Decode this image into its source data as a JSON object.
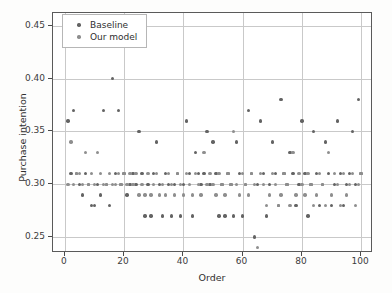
{
  "chart_data": {
    "type": "scatter",
    "title": "",
    "xlabel": "Order",
    "ylabel": "Purchase intention",
    "xlim": [
      -4,
      104
    ],
    "ylim": [
      0.235,
      0.462
    ],
    "xticks": [
      0,
      20,
      40,
      60,
      80,
      100
    ],
    "xtick_labels": [
      "0",
      "20",
      "40",
      "60",
      "80",
      "100"
    ],
    "yticks": [
      0.25,
      0.3,
      0.35,
      0.4,
      0.45
    ],
    "ytick_labels": [
      "0.25",
      "0.30",
      "0.35",
      "0.40",
      "0.45"
    ],
    "grid": true,
    "legend_position": "upper left",
    "series": [
      {
        "name": "Baseline",
        "color": "#636363",
        "marker": "circle",
        "points": [
          [
            1,
            0.36
          ],
          [
            2,
            0.31
          ],
          [
            3,
            0.37
          ],
          [
            4,
            0.31
          ],
          [
            5,
            0.3
          ],
          [
            6,
            0.29
          ],
          [
            7,
            0.31
          ],
          [
            8,
            0.3
          ],
          [
            9,
            0.28
          ],
          [
            10,
            0.28
          ],
          [
            11,
            0.3
          ],
          [
            12,
            0.29
          ],
          [
            13,
            0.37
          ],
          [
            14,
            0.3
          ],
          [
            15,
            0.28
          ],
          [
            16,
            0.4
          ],
          [
            17,
            0.31
          ],
          [
            18,
            0.37
          ],
          [
            19,
            0.3
          ],
          [
            20,
            0.31
          ],
          [
            21,
            0.29
          ],
          [
            22,
            0.3
          ],
          [
            23,
            0.31
          ],
          [
            24,
            0.3
          ],
          [
            25,
            0.35
          ],
          [
            26,
            0.31
          ],
          [
            27,
            0.27
          ],
          [
            28,
            0.3
          ],
          [
            29,
            0.27
          ],
          [
            30,
            0.31
          ],
          [
            31,
            0.34
          ],
          [
            32,
            0.3
          ],
          [
            33,
            0.27
          ],
          [
            34,
            0.31
          ],
          [
            35,
            0.3
          ],
          [
            36,
            0.27
          ],
          [
            37,
            0.3
          ],
          [
            38,
            0.31
          ],
          [
            39,
            0.27
          ],
          [
            40,
            0.3
          ],
          [
            41,
            0.36
          ],
          [
            42,
            0.31
          ],
          [
            43,
            0.27
          ],
          [
            44,
            0.33
          ],
          [
            45,
            0.31
          ],
          [
            46,
            0.3
          ],
          [
            47,
            0.31
          ],
          [
            48,
            0.35
          ],
          [
            49,
            0.3
          ],
          [
            50,
            0.34
          ],
          [
            51,
            0.31
          ],
          [
            52,
            0.27
          ],
          [
            53,
            0.3
          ],
          [
            54,
            0.27
          ],
          [
            55,
            0.31
          ],
          [
            56,
            0.3
          ],
          [
            57,
            0.27
          ],
          [
            58,
            0.34
          ],
          [
            59,
            0.31
          ],
          [
            60,
            0.27
          ],
          [
            61,
            0.3
          ],
          [
            62,
            0.37
          ],
          [
            63,
            0.31
          ],
          [
            64,
            0.25
          ],
          [
            65,
            0.3
          ],
          [
            66,
            0.36
          ],
          [
            67,
            0.31
          ],
          [
            68,
            0.27
          ],
          [
            69,
            0.3
          ],
          [
            70,
            0.34
          ],
          [
            71,
            0.31
          ],
          [
            72,
            0.28
          ],
          [
            73,
            0.38
          ],
          [
            74,
            0.31
          ],
          [
            75,
            0.3
          ],
          [
            76,
            0.33
          ],
          [
            77,
            0.31
          ],
          [
            78,
            0.28
          ],
          [
            79,
            0.3
          ],
          [
            80,
            0.36
          ],
          [
            81,
            0.31
          ],
          [
            82,
            0.27
          ],
          [
            83,
            0.3
          ],
          [
            84,
            0.35
          ],
          [
            85,
            0.31
          ],
          [
            86,
            0.28
          ],
          [
            87,
            0.3
          ],
          [
            88,
            0.34
          ],
          [
            89,
            0.31
          ],
          [
            90,
            0.28
          ],
          [
            91,
            0.3
          ],
          [
            92,
            0.36
          ],
          [
            93,
            0.31
          ],
          [
            94,
            0.28
          ],
          [
            95,
            0.3
          ],
          [
            96,
            0.31
          ],
          [
            97,
            0.35
          ],
          [
            98,
            0.3
          ],
          [
            99,
            0.38
          ],
          [
            100,
            0.31
          ]
        ]
      },
      {
        "name": "Our model",
        "color": "#8e8e8e",
        "marker": "circle",
        "points": [
          [
            1,
            0.3
          ],
          [
            2,
            0.34
          ],
          [
            3,
            0.3
          ],
          [
            4,
            0.31
          ],
          [
            5,
            0.31
          ],
          [
            6,
            0.3
          ],
          [
            7,
            0.33
          ],
          [
            8,
            0.3
          ],
          [
            9,
            0.31
          ],
          [
            10,
            0.3
          ],
          [
            11,
            0.33
          ],
          [
            12,
            0.31
          ],
          [
            13,
            0.3
          ],
          [
            14,
            0.3
          ],
          [
            15,
            0.31
          ],
          [
            16,
            0.3
          ],
          [
            17,
            0.3
          ],
          [
            18,
            0.31
          ],
          [
            19,
            0.3
          ],
          [
            20,
            0.31
          ],
          [
            21,
            0.3
          ],
          [
            22,
            0.31
          ],
          [
            23,
            0.3
          ],
          [
            24,
            0.31
          ],
          [
            25,
            0.29
          ],
          [
            26,
            0.3
          ],
          [
            27,
            0.29
          ],
          [
            28,
            0.31
          ],
          [
            29,
            0.29
          ],
          [
            30,
            0.3
          ],
          [
            31,
            0.31
          ],
          [
            32,
            0.29
          ],
          [
            33,
            0.3
          ],
          [
            34,
            0.29
          ],
          [
            35,
            0.31
          ],
          [
            36,
            0.3
          ],
          [
            37,
            0.29
          ],
          [
            38,
            0.31
          ],
          [
            39,
            0.3
          ],
          [
            40,
            0.29
          ],
          [
            41,
            0.31
          ],
          [
            42,
            0.3
          ],
          [
            43,
            0.29
          ],
          [
            44,
            0.31
          ],
          [
            45,
            0.3
          ],
          [
            46,
            0.29
          ],
          [
            47,
            0.33
          ],
          [
            48,
            0.3
          ],
          [
            49,
            0.31
          ],
          [
            50,
            0.3
          ],
          [
            51,
            0.29
          ],
          [
            52,
            0.31
          ],
          [
            53,
            0.3
          ],
          [
            54,
            0.29
          ],
          [
            55,
            0.31
          ],
          [
            56,
            0.3
          ],
          [
            57,
            0.35
          ],
          [
            58,
            0.3
          ],
          [
            59,
            0.29
          ],
          [
            60,
            0.31
          ],
          [
            61,
            0.3
          ],
          [
            62,
            0.29
          ],
          [
            63,
            0.31
          ],
          [
            64,
            0.3
          ],
          [
            65,
            0.24
          ],
          [
            66,
            0.31
          ],
          [
            67,
            0.3
          ],
          [
            68,
            0.28
          ],
          [
            69,
            0.29
          ],
          [
            70,
            0.31
          ],
          [
            71,
            0.3
          ],
          [
            72,
            0.28
          ],
          [
            73,
            0.29
          ],
          [
            74,
            0.31
          ],
          [
            75,
            0.3
          ],
          [
            76,
            0.28
          ],
          [
            77,
            0.33
          ],
          [
            78,
            0.29
          ],
          [
            79,
            0.31
          ],
          [
            80,
            0.3
          ],
          [
            81,
            0.29
          ],
          [
            82,
            0.31
          ],
          [
            83,
            0.3
          ],
          [
            84,
            0.28
          ],
          [
            85,
            0.29
          ],
          [
            86,
            0.31
          ],
          [
            87,
            0.3
          ],
          [
            88,
            0.28
          ],
          [
            89,
            0.33
          ],
          [
            90,
            0.29
          ],
          [
            91,
            0.31
          ],
          [
            92,
            0.3
          ],
          [
            93,
            0.28
          ],
          [
            94,
            0.31
          ],
          [
            95,
            0.29
          ],
          [
            96,
            0.3
          ],
          [
            97,
            0.31
          ],
          [
            98,
            0.28
          ],
          [
            99,
            0.3
          ],
          [
            100,
            0.31
          ]
        ]
      }
    ]
  },
  "legend": {
    "entries": [
      {
        "label": "Baseline",
        "color": "#636363"
      },
      {
        "label": "Our model",
        "color": "#8e8e8e"
      }
    ]
  }
}
